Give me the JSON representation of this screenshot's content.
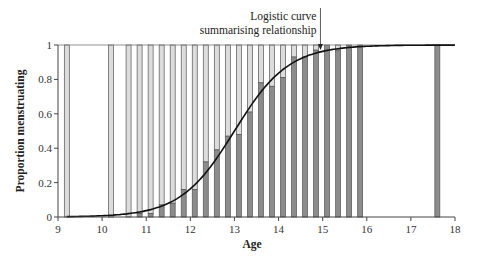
{
  "chart_data": {
    "type": "bar",
    "title": "",
    "xlabel": "Age",
    "ylabel": "Proportion menstruating",
    "xlim": [
      9,
      18
    ],
    "ylim": [
      0,
      1
    ],
    "x_ticks": [
      9,
      10,
      11,
      12,
      13,
      14,
      15,
      16,
      17,
      18
    ],
    "y_ticks": [
      0,
      0.2,
      0.4,
      0.6,
      0.8,
      1
    ],
    "y_tick_labels": [
      "0",
      "0.2",
      "0.4",
      "0.6",
      "0.8",
      "1"
    ],
    "grid": false,
    "legend": null,
    "annotation": {
      "lines": [
        "Logistic curve",
        "summarising relationship"
      ],
      "points_to_x": 14.95
    },
    "series": [
      {
        "name": "Proportion menstruating",
        "style": "stacked bars (dark = yes, light = no, totaling 1)",
        "x": [
          9.2,
          10.2,
          10.6,
          10.85,
          11.1,
          11.35,
          11.6,
          11.85,
          12.1,
          12.35,
          12.6,
          12.85,
          13.1,
          13.35,
          13.6,
          13.85,
          14.1,
          14.35,
          14.6,
          14.85,
          15.1,
          15.35,
          15.6,
          15.85,
          17.6
        ],
        "values": [
          0,
          0,
          0,
          0.02,
          0.02,
          0.07,
          0.08,
          0.16,
          0.16,
          0.32,
          0.39,
          0.47,
          0.48,
          0.61,
          0.78,
          0.76,
          0.81,
          0.93,
          0.93,
          0.97,
          1.0,
          0.97,
          1.0,
          1.0,
          1.0
        ]
      },
      {
        "name": "Logistic curve",
        "type": "line",
        "model": "p = 1 / (1 + exp(-(a + b*age)))",
        "midpoint_age": 13.0,
        "slope": 1.63
      }
    ]
  },
  "colors": {
    "bar_dark": "#8c8c8c",
    "bar_light": "#dcdcdc",
    "bar_edge": "#555555",
    "curve": "#111111",
    "axis": "#444444"
  }
}
